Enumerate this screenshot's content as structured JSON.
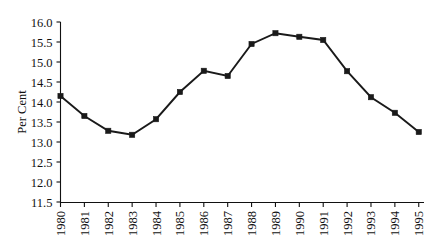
{
  "chart_data": {
    "type": "line",
    "title": "",
    "xlabel": "",
    "ylabel": "Per Cent",
    "x": [
      1980,
      1981,
      1982,
      1983,
      1984,
      1985,
      1986,
      1987,
      1988,
      1989,
      1990,
      1991,
      1992,
      1993,
      1994,
      1995
    ],
    "categories": [
      "1980",
      "1981",
      "1982",
      "1983",
      "1984",
      "1985",
      "1986",
      "1987",
      "1988",
      "1989",
      "1990",
      "1991",
      "1992",
      "1993",
      "1994",
      "1995"
    ],
    "values": [
      14.15,
      13.65,
      13.28,
      13.18,
      13.57,
      14.25,
      14.78,
      14.65,
      15.45,
      15.72,
      15.63,
      15.55,
      14.77,
      14.12,
      13.73,
      13.25
    ],
    "series": [
      {
        "name": "Per Cent",
        "values": [
          14.15,
          13.65,
          13.28,
          13.18,
          13.57,
          14.25,
          14.78,
          14.65,
          15.45,
          15.72,
          15.63,
          15.55,
          14.77,
          14.12,
          13.73,
          13.25
        ],
        "color": "#1a1a1a",
        "marker": "square"
      }
    ],
    "ylim": [
      11.5,
      16.0
    ],
    "ytick_step": 0.5,
    "ytick_labels": [
      "16.0",
      "15.5",
      "15.0",
      "14.5",
      "14.0",
      "13.5",
      "13.0",
      "12.5",
      "12.0",
      "11.5"
    ],
    "ytick_values": [
      16.0,
      15.5,
      15.0,
      14.5,
      14.0,
      13.5,
      13.0,
      12.5,
      12.0,
      11.5
    ],
    "xtick_labels": [
      "1980",
      "1981",
      "1982",
      "1983",
      "1984",
      "1985",
      "1986",
      "1987",
      "1988",
      "1989",
      "1990",
      "1991",
      "1992",
      "1993",
      "1994",
      "1995"
    ],
    "xtick_label_rotation": -90,
    "grid": false,
    "legend": false,
    "legend_position": "none",
    "annotations": []
  },
  "colors": {
    "line": "#1a1a1a",
    "marker": "#1a1a1a",
    "axis": "#111111",
    "text": "#111111",
    "background": "#ffffff"
  }
}
